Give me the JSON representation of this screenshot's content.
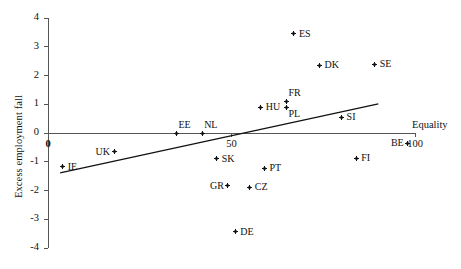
{
  "chart_data": {
    "type": "scatter",
    "title": "",
    "xlabel": "Equality",
    "ylabel": "Excess employment fall",
    "xlim": [
      0,
      110
    ],
    "ylim": [
      -4,
      4
    ],
    "xticks": [
      "0",
      "50",
      "100"
    ],
    "xtick_values": [
      0,
      50,
      100
    ],
    "yticks": [
      "4",
      "3",
      "2",
      "1",
      "0",
      "-1",
      "-2",
      "-3",
      "-4"
    ],
    "ytick_values": [
      4,
      3,
      2,
      1,
      0,
      -1,
      -2,
      -3,
      -4
    ],
    "grid": false,
    "legend": "none",
    "points": [
      {
        "label": "IE",
        "x": 4,
        "y": -1.18,
        "label_side": "right"
      },
      {
        "label": "UK",
        "x": 18,
        "y": -0.66,
        "label_side": "left"
      },
      {
        "label": "EE",
        "x": 35,
        "y": 0.0,
        "label_side": "above-right"
      },
      {
        "label": "NL",
        "x": 42,
        "y": 0.0,
        "label_side": "above-right"
      },
      {
        "label": "SK",
        "x": 46,
        "y": -0.9,
        "label_side": "right"
      },
      {
        "label": "GR",
        "x": 49,
        "y": -1.84,
        "label_side": "left"
      },
      {
        "label": "DE",
        "x": 51,
        "y": -3.44,
        "label_side": "right"
      },
      {
        "label": "CZ",
        "x": 55,
        "y": -1.88,
        "label_side": "right"
      },
      {
        "label": "HU",
        "x": 58,
        "y": 0.9,
        "label_side": "right"
      },
      {
        "label": "PT",
        "x": 59,
        "y": -1.22,
        "label_side": "right"
      },
      {
        "label": "ES",
        "x": 67,
        "y": 3.45,
        "label_side": "right"
      },
      {
        "label": "PL",
        "x": 65,
        "y": 0.87,
        "label_side": "below-right"
      },
      {
        "label": "FR",
        "x": 65,
        "y": 1.1,
        "label_side": "above-right"
      },
      {
        "label": "DK",
        "x": 74,
        "y": 2.35,
        "label_side": "right"
      },
      {
        "label": "SI",
        "x": 80,
        "y": 0.55,
        "label_side": "right"
      },
      {
        "label": "SE",
        "x": 89,
        "y": 2.4,
        "label_side": "right"
      },
      {
        "label": "FI",
        "x": 84,
        "y": -0.87,
        "label_side": "right"
      },
      {
        "label": "BE",
        "x": 98,
        "y": -0.35,
        "label_side": "left"
      }
    ],
    "trendline": {
      "x_start": 3.3,
      "y_start": -1.39,
      "x_end": 90.0,
      "y_end": 1.01,
      "style": "solid",
      "color": "#111111"
    },
    "zero_line": {
      "y": 0,
      "color": "#555555"
    }
  },
  "axis": {
    "x_title": "Equality",
    "y_title": "Excess employment fall",
    "origin_label": "0",
    "x_mid_label": "50",
    "x_end_label": "100"
  },
  "colors": {
    "ink": "#111111",
    "axis": "#555555",
    "background": "#ffffff"
  }
}
